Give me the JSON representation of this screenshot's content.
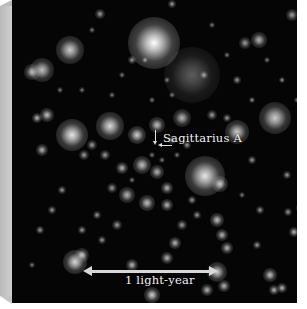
{
  "image": {
    "subject": "star field at the galactic center",
    "background_color": "#050505",
    "frame_color": "#b9b9b9"
  },
  "labels": {
    "target": "Sagittarius A",
    "scale": "1 light-year"
  },
  "stars": [
    {
      "x": 142,
      "y": 43,
      "r": 26,
      "b": 1.0
    },
    {
      "x": 58,
      "y": 50,
      "r": 14,
      "b": 0.8
    },
    {
      "x": 30,
      "y": 70,
      "r": 12,
      "b": 0.75
    },
    {
      "x": 20,
      "y": 72,
      "r": 8,
      "b": 0.7
    },
    {
      "x": 180,
      "y": 75,
      "r": 28,
      "b": 0.35
    },
    {
      "x": 247,
      "y": 40,
      "r": 8,
      "b": 0.7
    },
    {
      "x": 233,
      "y": 43,
      "r": 6,
      "b": 0.6
    },
    {
      "x": 280,
      "y": 15,
      "r": 6,
      "b": 0.6
    },
    {
      "x": 88,
      "y": 14,
      "r": 5,
      "b": 0.6
    },
    {
      "x": 160,
      "y": 4,
      "r": 4,
      "b": 0.6
    },
    {
      "x": 263,
      "y": 118,
      "r": 16,
      "b": 0.8
    },
    {
      "x": 225,
      "y": 132,
      "r": 12,
      "b": 0.8
    },
    {
      "x": 60,
      "y": 135,
      "r": 16,
      "b": 0.9
    },
    {
      "x": 98,
      "y": 126,
      "r": 14,
      "b": 0.85
    },
    {
      "x": 125,
      "y": 135,
      "r": 9,
      "b": 0.8
    },
    {
      "x": 145,
      "y": 125,
      "r": 8,
      "b": 0.75
    },
    {
      "x": 35,
      "y": 115,
      "r": 7,
      "b": 0.75
    },
    {
      "x": 25,
      "y": 118,
      "r": 5,
      "b": 0.7
    },
    {
      "x": 30,
      "y": 150,
      "r": 6,
      "b": 0.7
    },
    {
      "x": 170,
      "y": 118,
      "r": 9,
      "b": 0.7
    },
    {
      "x": 200,
      "y": 115,
      "r": 5,
      "b": 0.6
    },
    {
      "x": 193,
      "y": 176,
      "r": 20,
      "b": 0.9
    },
    {
      "x": 208,
      "y": 184,
      "r": 8,
      "b": 0.75
    },
    {
      "x": 130,
      "y": 165,
      "r": 9,
      "b": 0.75
    },
    {
      "x": 145,
      "y": 172,
      "r": 7,
      "b": 0.7
    },
    {
      "x": 110,
      "y": 168,
      "r": 6,
      "b": 0.7
    },
    {
      "x": 115,
      "y": 195,
      "r": 8,
      "b": 0.7
    },
    {
      "x": 135,
      "y": 203,
      "r": 8,
      "b": 0.75
    },
    {
      "x": 155,
      "y": 188,
      "r": 6,
      "b": 0.7
    },
    {
      "x": 155,
      "y": 205,
      "r": 6,
      "b": 0.7
    },
    {
      "x": 100,
      "y": 188,
      "r": 5,
      "b": 0.6
    },
    {
      "x": 93,
      "y": 155,
      "r": 5,
      "b": 0.6
    },
    {
      "x": 80,
      "y": 145,
      "r": 5,
      "b": 0.6
    },
    {
      "x": 72,
      "y": 155,
      "r": 5,
      "b": 0.6
    },
    {
      "x": 160,
      "y": 140,
      "r": 4,
      "b": 0.6
    },
    {
      "x": 175,
      "y": 145,
      "r": 4,
      "b": 0.6
    },
    {
      "x": 205,
      "y": 220,
      "r": 7,
      "b": 0.75
    },
    {
      "x": 210,
      "y": 235,
      "r": 6,
      "b": 0.7
    },
    {
      "x": 215,
      "y": 248,
      "r": 6,
      "b": 0.7
    },
    {
      "x": 163,
      "y": 243,
      "r": 6,
      "b": 0.7
    },
    {
      "x": 170,
      "y": 225,
      "r": 5,
      "b": 0.6
    },
    {
      "x": 63,
      "y": 262,
      "r": 12,
      "b": 0.85
    },
    {
      "x": 70,
      "y": 255,
      "r": 7,
      "b": 0.75
    },
    {
      "x": 120,
      "y": 265,
      "r": 6,
      "b": 0.7
    },
    {
      "x": 155,
      "y": 258,
      "r": 6,
      "b": 0.7
    },
    {
      "x": 140,
      "y": 295,
      "r": 8,
      "b": 0.8
    },
    {
      "x": 195,
      "y": 290,
      "r": 6,
      "b": 0.7
    },
    {
      "x": 205,
      "y": 272,
      "r": 10,
      "b": 0.8
    },
    {
      "x": 212,
      "y": 286,
      "r": 6,
      "b": 0.7
    },
    {
      "x": 258,
      "y": 275,
      "r": 7,
      "b": 0.75
    },
    {
      "x": 262,
      "y": 290,
      "r": 5,
      "b": 0.7
    },
    {
      "x": 270,
      "y": 288,
      "r": 5,
      "b": 0.7
    },
    {
      "x": 282,
      "y": 232,
      "r": 5,
      "b": 0.7
    },
    {
      "x": 288,
      "y": 208,
      "r": 4,
      "b": 0.6
    },
    {
      "x": 276,
      "y": 212,
      "r": 4,
      "b": 0.6
    },
    {
      "x": 248,
      "y": 210,
      "r": 4,
      "b": 0.6
    },
    {
      "x": 275,
      "y": 175,
      "r": 4,
      "b": 0.6
    },
    {
      "x": 240,
      "y": 160,
      "r": 4,
      "b": 0.6
    },
    {
      "x": 105,
      "y": 225,
      "r": 5,
      "b": 0.6
    },
    {
      "x": 85,
      "y": 215,
      "r": 4,
      "b": 0.6
    },
    {
      "x": 50,
      "y": 190,
      "r": 4,
      "b": 0.6
    },
    {
      "x": 40,
      "y": 210,
      "r": 4,
      "b": 0.6
    },
    {
      "x": 28,
      "y": 230,
      "r": 4,
      "b": 0.6
    },
    {
      "x": 70,
      "y": 230,
      "r": 4,
      "b": 0.6
    },
    {
      "x": 90,
      "y": 240,
      "r": 4,
      "b": 0.6
    },
    {
      "x": 120,
      "y": 60,
      "r": 4,
      "b": 0.6
    },
    {
      "x": 133,
      "y": 60,
      "r": 3,
      "b": 0.6
    },
    {
      "x": 192,
      "y": 75,
      "r": 4,
      "b": 0.6
    },
    {
      "x": 225,
      "y": 80,
      "r": 4,
      "b": 0.6
    },
    {
      "x": 270,
      "y": 80,
      "r": 3,
      "b": 0.6
    },
    {
      "x": 240,
      "y": 100,
      "r": 3,
      "b": 0.6
    },
    {
      "x": 215,
      "y": 118,
      "r": 4,
      "b": 0.6
    },
    {
      "x": 285,
      "y": 100,
      "r": 3,
      "b": 0.5
    },
    {
      "x": 20,
      "y": 265,
      "r": 3,
      "b": 0.5
    },
    {
      "x": 245,
      "y": 245,
      "r": 4,
      "b": 0.6
    },
    {
      "x": 230,
      "y": 195,
      "r": 3,
      "b": 0.5
    },
    {
      "x": 180,
      "y": 200,
      "r": 4,
      "b": 0.6
    },
    {
      "x": 185,
      "y": 215,
      "r": 4,
      "b": 0.6
    },
    {
      "x": 165,
      "y": 155,
      "r": 3,
      "b": 0.5
    },
    {
      "x": 140,
      "y": 155,
      "r": 3,
      "b": 0.5
    },
    {
      "x": 150,
      "y": 160,
      "r": 3,
      "b": 0.5
    },
    {
      "x": 120,
      "y": 180,
      "r": 3,
      "b": 0.5
    },
    {
      "x": 48,
      "y": 90,
      "r": 3,
      "b": 0.5
    },
    {
      "x": 70,
      "y": 90,
      "r": 3,
      "b": 0.5
    },
    {
      "x": 100,
      "y": 95,
      "r": 3,
      "b": 0.5
    },
    {
      "x": 140,
      "y": 100,
      "r": 3,
      "b": 0.5
    },
    {
      "x": 160,
      "y": 95,
      "r": 3,
      "b": 0.5
    },
    {
      "x": 155,
      "y": 80,
      "r": 3,
      "b": 0.5
    },
    {
      "x": 110,
      "y": 75,
      "r": 3,
      "b": 0.5
    },
    {
      "x": 80,
      "y": 30,
      "r": 3,
      "b": 0.5
    },
    {
      "x": 200,
      "y": 25,
      "r": 3,
      "b": 0.5
    },
    {
      "x": 215,
      "y": 55,
      "r": 3,
      "b": 0.5
    },
    {
      "x": 255,
      "y": 60,
      "r": 3,
      "b": 0.5
    },
    {
      "x": 290,
      "y": 50,
      "r": 3,
      "b": 0.5
    }
  ]
}
